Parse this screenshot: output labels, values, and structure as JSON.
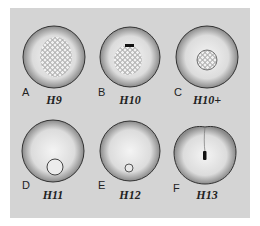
{
  "figure": {
    "background_color": "#d4d4d4",
    "panels": [
      {
        "letter": "A",
        "stage": "H9",
        "feature": "large cellular blastoderm patch"
      },
      {
        "letter": "B",
        "stage": "H10",
        "feature": "cellular patch with dark groove at top"
      },
      {
        "letter": "C",
        "stage": "H10+",
        "feature": "small circular cellular area"
      },
      {
        "letter": "D",
        "stage": "H11",
        "feature": "small ring near bottom"
      },
      {
        "letter": "E",
        "stage": "H12",
        "feature": "tiny ring near bottom"
      },
      {
        "letter": "F",
        "stage": "H13",
        "feature": "dark vertical streak with top notch"
      }
    ]
  }
}
